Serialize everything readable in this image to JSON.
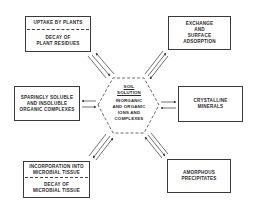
{
  "diagram": {
    "center": {
      "title_lines": [
        "SOIL",
        "SOLUTION"
      ],
      "body_lines": [
        "INORGANIC",
        "AND ORGANIC",
        "IONS AND",
        "COMPLEXES"
      ]
    },
    "nodes": [
      {
        "id": "top-left",
        "parts": [
          {
            "lines": [
              "UPTAKE BY PLANTS"
            ]
          },
          {
            "lines": [
              "DECAY OF",
              "PLANT RESIDUES"
            ]
          }
        ]
      },
      {
        "id": "top-right",
        "parts": [
          {
            "lines": [
              "EXCHANGE",
              "AND",
              "SURFACE",
              "ADSORPTION"
            ]
          }
        ]
      },
      {
        "id": "mid-left",
        "parts": [
          {
            "lines": [
              "SPARINGLY SOLUBLE",
              "AND INSOLUBLE",
              "ORGANIC COMPLEXES"
            ]
          }
        ]
      },
      {
        "id": "mid-right",
        "parts": [
          {
            "lines": [
              "CRYSTALLINE",
              "MINERALS"
            ]
          }
        ]
      },
      {
        "id": "bottom-left",
        "parts": [
          {
            "lines": [
              "INCORPORATION INTO",
              "MICROBIAL TISSUE"
            ]
          },
          {
            "lines": [
              "DECAY OF",
              "MICROBIAL TISSUE"
            ]
          }
        ]
      },
      {
        "id": "bottom-right",
        "parts": [
          {
            "lines": [
              "AMORPHOUS",
              "PRECIPITATES"
            ]
          }
        ]
      }
    ],
    "arrows": "double (bidirectional) arrows connect each outer node with the central soil solution hexagon",
    "colors": {
      "line": "#3a3a3a",
      "background": "#ffffff"
    }
  }
}
